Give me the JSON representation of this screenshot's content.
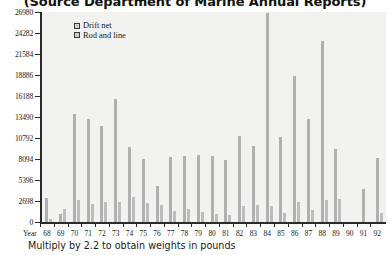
{
  "chart_data": {
    "type": "bar",
    "title": "(Source Department of Marine Annual Reports)",
    "xlabel": "Year",
    "ylabel": "",
    "ylim": [
      0,
      26980
    ],
    "yticks": [
      0,
      2698,
      5396,
      8094,
      10792,
      13490,
      16188,
      18886,
      21584,
      24282,
      26980
    ],
    "ytick_labels": [
      "0",
      "2698",
      "5396",
      "8094",
      "10792",
      "13490",
      "16188",
      "18886",
      "21584",
      "24282",
      "26980"
    ],
    "grid": false,
    "legend_position": "top-left",
    "footnote": "Multiply by 2.2 to obtain weights in pounds",
    "categories": [
      "68",
      "69",
      "70",
      "71",
      "72",
      "73",
      "74",
      "75",
      "76",
      "77",
      "78",
      "79",
      "80",
      "81",
      "82",
      "83",
      "84",
      "85",
      "86",
      "87",
      "88",
      "89",
      "90",
      "91",
      "92"
    ],
    "series": [
      {
        "name": "Drift net",
        "color": "#b0b0b0",
        "values": [
          3100,
          1000,
          13900,
          13200,
          12300,
          15800,
          9700,
          8100,
          4600,
          8300,
          8500,
          8600,
          8500,
          8000,
          11100,
          9800,
          26900,
          10900,
          18800,
          13200,
          23200,
          9400,
          0,
          4300,
          8200
        ]
      },
      {
        "name": "Rod and line",
        "color": "#bdbdbd",
        "values": [
          350,
          1700,
          2800,
          2300,
          2600,
          2600,
          3200,
          2500,
          2200,
          1400,
          1700,
          1300,
          1000,
          900,
          2100,
          2200,
          2100,
          1100,
          2600,
          1500,
          2800,
          3000,
          0,
          0,
          1200
        ]
      }
    ]
  },
  "legend": {
    "items": [
      {
        "label": "Drift net"
      },
      {
        "label": "Rod and line"
      }
    ]
  }
}
